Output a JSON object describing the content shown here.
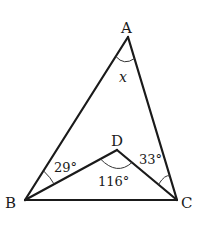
{
  "diagram": {
    "type": "geometry",
    "points": {
      "A": {
        "label": "A",
        "x": 128,
        "y": 37
      },
      "B": {
        "label": "B",
        "x": 25,
        "y": 200
      },
      "C": {
        "label": "C",
        "x": 177,
        "y": 200
      },
      "D": {
        "label": "D",
        "x": 117,
        "y": 150
      }
    },
    "segments": [
      "AB",
      "AC",
      "BC",
      "BD",
      "DC"
    ],
    "angles": {
      "A": {
        "label": "x",
        "vertex": "A",
        "between": [
          "AB",
          "AC"
        ]
      },
      "ABD": {
        "label": "29°",
        "vertex": "B",
        "between": [
          "BA",
          "BD"
        ]
      },
      "ACD": {
        "label": "33°",
        "vertex": "C",
        "between": [
          "CA",
          "CD"
        ]
      },
      "BDC": {
        "label": "116°",
        "vertex": "D",
        "between": [
          "DB",
          "DC"
        ]
      }
    },
    "colors": {
      "line": "#1a1a1a",
      "background": "#ffffff"
    }
  }
}
